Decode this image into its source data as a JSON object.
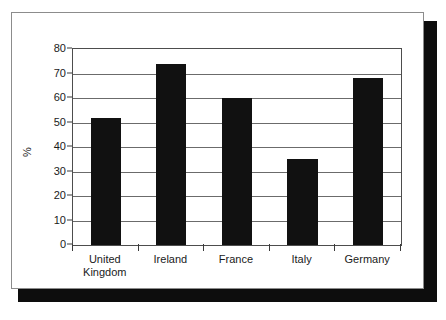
{
  "chart_data": {
    "type": "bar",
    "title": "",
    "xlabel": "",
    "ylabel": "%",
    "categories": [
      "United Kingdom",
      "Ireland",
      "France",
      "Italy",
      "Germany"
    ],
    "category_lines": [
      [
        "United",
        "Kingdom"
      ],
      [
        "Ireland"
      ],
      [
        "France"
      ],
      [
        "Italy"
      ],
      [
        "Germany"
      ]
    ],
    "values": [
      52,
      74,
      60,
      35,
      68
    ],
    "ylim": [
      0,
      80
    ],
    "ytick_step": 10,
    "yticks": [
      0,
      10,
      20,
      30,
      40,
      50,
      60,
      70,
      80
    ],
    "ytick_labels": [
      "0",
      "10",
      "20",
      "30",
      "40",
      "50",
      "60",
      "70",
      "80"
    ],
    "grid": true,
    "grid_axis": "y",
    "legend": false,
    "legend_position": "none",
    "bar_color": "#111111",
    "grid_color": "#6b6b6b",
    "axis_color": "#4d4d4d",
    "background_color": "#ffffff",
    "shadow_color": "#0d0d0d"
  }
}
